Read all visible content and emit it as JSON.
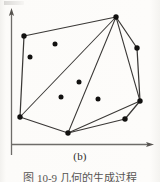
{
  "figure": {
    "subcaption": "(b)",
    "page_caption": "图 10-9    几何的生成过程",
    "colors": {
      "background": "#fcfbf9",
      "axis": "#6e6c69",
      "hull_line": "#3b3937",
      "point_fill": "#121110",
      "caption_text": "#2e2c2b"
    },
    "axes": {
      "y_axis": {
        "x": 11,
        "y_bottom": 155,
        "y_top": 10,
        "arrow": "up"
      },
      "x_axis": {
        "y": 144,
        "x_left": 11,
        "x_right": 153,
        "arrow": "right"
      },
      "tick_labels": [],
      "grid": false
    }
  },
  "chart_data": {
    "type": "scatter",
    "title": "(b)",
    "xlabel": "",
    "ylabel": "",
    "grid": false,
    "legend": "none",
    "xlim": [
      0,
      160
    ],
    "ylim": [
      0,
      160
    ],
    "note": "Convex hull of a planar point set, drawn with interior diagonals fanning from the top apex vertex.",
    "points": [
      {
        "id": "p1",
        "x": 24,
        "y": 36,
        "role": "hull-vertex"
      },
      {
        "id": "p2",
        "x": 116,
        "y": 17,
        "role": "hull-vertex"
      },
      {
        "id": "p3",
        "x": 137,
        "y": 48,
        "role": "hull-vertex"
      },
      {
        "id": "p4",
        "x": 140,
        "y": 101,
        "role": "hull-vertex"
      },
      {
        "id": "p5",
        "x": 125,
        "y": 119,
        "role": "hull-vertex"
      },
      {
        "id": "p6",
        "x": 68,
        "y": 133,
        "role": "hull-vertex"
      },
      {
        "id": "p7",
        "x": 20,
        "y": 117,
        "role": "hull-vertex"
      },
      {
        "id": "p8",
        "x": 55,
        "y": 44,
        "role": "interior"
      },
      {
        "id": "p9",
        "x": 30,
        "y": 57,
        "role": "interior"
      },
      {
        "id": "p10",
        "x": 79,
        "y": 82,
        "role": "interior"
      },
      {
        "id": "p11",
        "x": 61,
        "y": 97,
        "role": "interior"
      },
      {
        "id": "p12",
        "x": 98,
        "y": 99,
        "role": "interior"
      }
    ],
    "hull_order": [
      "p1",
      "p2",
      "p3",
      "p4",
      "p5",
      "p6",
      "p7"
    ],
    "diagonals": [
      {
        "from": "p2",
        "to": "p7"
      },
      {
        "from": "p2",
        "to": "p6"
      },
      {
        "from": "p2",
        "to": "p4"
      },
      {
        "from": "p4",
        "to": "p6"
      }
    ]
  }
}
